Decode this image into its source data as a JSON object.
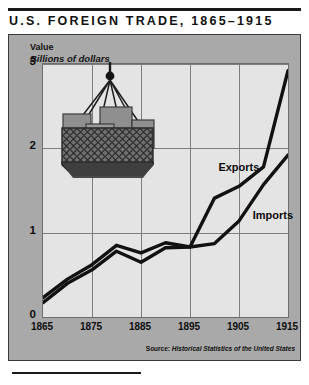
{
  "title": "U.S. FOREIGN TRADE, 1865–1915",
  "axis_title": "Value",
  "axis_subtitle": "Billions of dollars",
  "source_prefix": "Source: ",
  "source_work": "Historical Statistics of the United States",
  "colors": {
    "page_background": "#ffffff",
    "panel_background": "#a9a9a9",
    "plot_background": "#e4e4e4",
    "gridline": "#7d7d7d",
    "line": "#111111",
    "text": "#111111",
    "crate_light": "#8f8f8f",
    "crate_mid": "#7a7a7a",
    "net_dark": "#474747"
  },
  "illustration": {
    "name": "cargo-sling-with-crates",
    "description": "crane hook lifting a rope net sling loaded with shipping crates"
  },
  "chart_data": {
    "type": "line",
    "title": "U.S. FOREIGN TRADE, 1865–1915",
    "xlabel": "",
    "ylabel": "Billions of dollars",
    "ylim": [
      0,
      3
    ],
    "xlim": [
      1865,
      1915
    ],
    "yticks": [
      0,
      1,
      2,
      3
    ],
    "xticks": [
      1865,
      1875,
      1885,
      1895,
      1905,
      1915
    ],
    "grid": true,
    "legend": "inline-labels",
    "x": [
      1865,
      1870,
      1875,
      1880,
      1885,
      1890,
      1895,
      1900,
      1905,
      1910,
      1915
    ],
    "series": [
      {
        "name": "Exports",
        "label_position": {
          "x": 1901,
          "y": 1.75
        },
        "values": [
          0.23,
          0.45,
          0.62,
          0.85,
          0.76,
          0.88,
          0.83,
          1.41,
          1.55,
          1.78,
          2.92
        ]
      },
      {
        "name": "Imports",
        "label_position": {
          "x": 1908,
          "y": 1.18
        },
        "values": [
          0.17,
          0.4,
          0.56,
          0.78,
          0.65,
          0.82,
          0.83,
          0.87,
          1.14,
          1.57,
          1.92
        ]
      }
    ]
  }
}
